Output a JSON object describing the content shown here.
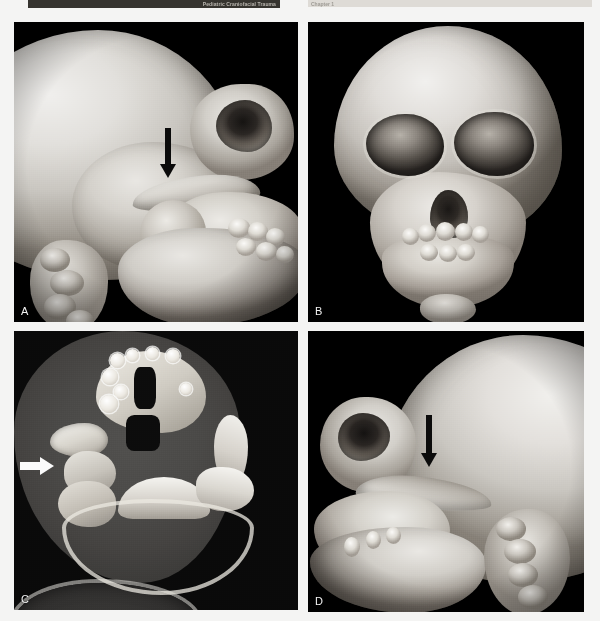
{
  "header": {
    "running_head": "Pediatric Craniofacial Trauma",
    "chapter_label": "Chapter 1"
  },
  "figure": {
    "panels": [
      {
        "id": "A",
        "label": "A",
        "modality": "3D CT reconstruction",
        "view": "lateral (right side)",
        "annotation": "black downward arrow",
        "finding": "depressed right zygomatic arch fracture"
      },
      {
        "id": "B",
        "label": "B",
        "modality": "3D CT reconstruction",
        "view": "frontal (anteroposterior)",
        "annotation": "none",
        "finding": "orbital rims and midface, deciduous dentition"
      },
      {
        "id": "C",
        "label": "C",
        "modality": "axial CT, bone window",
        "view": "axial through skull base",
        "annotation": "white rightward arrow",
        "finding": "right zygomatic arch fracture"
      },
      {
        "id": "D",
        "label": "D",
        "modality": "3D CT reconstruction",
        "view": "lateral (left side)",
        "annotation": "black downward arrow",
        "finding": "contralateral zygomatic arch"
      }
    ]
  }
}
